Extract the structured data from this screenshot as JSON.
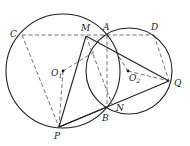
{
  "diagram": {
    "type": "geometry",
    "colors": {
      "stroke": "#222222",
      "background": "#ffffff"
    },
    "circles": [
      {
        "name": "O1",
        "cx": 63,
        "cy": 71,
        "r": 57
      },
      {
        "name": "O2",
        "cx": 129,
        "cy": 71,
        "r": 43
      }
    ],
    "points": {
      "C": {
        "label": "C",
        "x": 22,
        "y": 35
      },
      "M": {
        "label": "M",
        "x": 86,
        "y": 36
      },
      "A": {
        "label": "A",
        "x": 107,
        "y": 35
      },
      "D": {
        "label": "D",
        "x": 154,
        "y": 35
      },
      "O1": {
        "label": "O",
        "sub": "1",
        "x": 63,
        "y": 71
      },
      "O2": {
        "label": "O",
        "sub": "2",
        "x": 128,
        "y": 71
      },
      "Q": {
        "label": "Q",
        "x": 169,
        "y": 81
      },
      "N": {
        "label": "N",
        "x": 112,
        "y": 104
      },
      "B": {
        "label": "B",
        "x": 107,
        "y": 107
      },
      "P": {
        "label": "P",
        "x": 59,
        "y": 127
      }
    },
    "solid_segments": [
      "MP",
      "MQ",
      "PQ",
      "PB"
    ],
    "dashed_segments": [
      "CD",
      "CP",
      "O1P",
      "O1-E",
      "AB",
      "MN",
      "DQ",
      "O2Q",
      "O2-E"
    ]
  }
}
